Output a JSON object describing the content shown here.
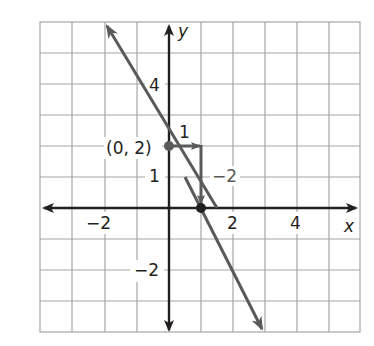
{
  "graph": {
    "x_range": [
      -4,
      6
    ],
    "y_range": [
      -4,
      6
    ],
    "axis_labels": {
      "x": "x",
      "y": "y"
    },
    "x_tick_labels": [
      {
        "value": -2,
        "text": "−2"
      },
      {
        "value": 2,
        "text": "2"
      },
      {
        "value": 4,
        "text": "4"
      }
    ],
    "y_tick_labels": [
      {
        "value": 4,
        "text": "4"
      },
      {
        "value": 1,
        "text": "1"
      },
      {
        "value": -2,
        "text": "−2"
      }
    ],
    "line": {
      "slope": -2,
      "intercept": 2,
      "color": "#5a5a5a"
    },
    "point_label": "(0, 2)",
    "rise_run": {
      "run_label": "1",
      "rise_label": "−2"
    },
    "colors": {
      "grid": "#a6a6a6",
      "axis": "#231f20",
      "line": "#5a5a5a"
    }
  }
}
